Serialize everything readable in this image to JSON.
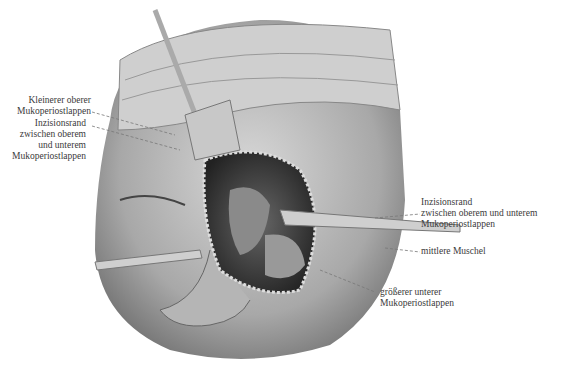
{
  "illustration": {
    "subject": "surgical illustration of face with retractors and nasal flap exposure",
    "labels": [
      {
        "id": "kleinerer",
        "lines": [
          "Kleinerer oberer",
          "Mukoperiostlappen"
        ]
      },
      {
        "id": "inzision-left",
        "lines": [
          "Inzisionsrand",
          "zwischen oberem",
          "und unterem",
          "Mukoperiostlappen"
        ]
      },
      {
        "id": "inzision-right",
        "lines": [
          "Inzisionsrand",
          "zwischen oberem und unterem",
          "Mukoperiostlappen"
        ]
      },
      {
        "id": "muschel",
        "lines": [
          "mittlere Muschel"
        ]
      },
      {
        "id": "groesserer",
        "lines": [
          "größerer unterer",
          "Mukoperiostlappen"
        ]
      }
    ]
  }
}
